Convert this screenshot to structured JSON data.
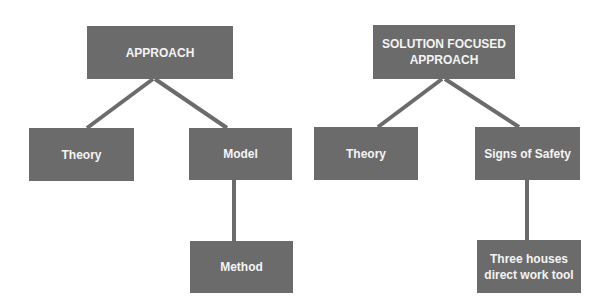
{
  "colors": {
    "node_fill": "#6b6b6b",
    "node_text": "#f4f4f4",
    "connector": "#6b6b6b",
    "background": "#ffffff"
  },
  "diagrams": [
    {
      "root": {
        "label": "APPROACH",
        "box": {
          "x": 87,
          "y": 26,
          "w": 146,
          "h": 53
        }
      },
      "children": [
        {
          "label": "Theory",
          "box": {
            "x": 29,
            "y": 128,
            "w": 105,
            "h": 53
          }
        },
        {
          "label": "Model",
          "box": {
            "x": 189,
            "y": 128,
            "w": 103,
            "h": 52
          },
          "children": [
            {
              "label": "Method",
              "box": {
                "x": 190,
                "y": 241,
                "w": 103,
                "h": 52
              }
            }
          ]
        }
      ]
    },
    {
      "root": {
        "label_line1": "SOLUTION FOCUSED",
        "label_line2": "APPROACH",
        "box": {
          "x": 373,
          "y": 25,
          "w": 142,
          "h": 54
        }
      },
      "children": [
        {
          "label": "Theory",
          "box": {
            "x": 314,
            "y": 127,
            "w": 104,
            "h": 53
          }
        },
        {
          "label": "Signs of Safety",
          "box": {
            "x": 475,
            "y": 127,
            "w": 105,
            "h": 53
          },
          "children": [
            {
              "label_line1": "Three houses",
              "label_line2": "direct work tool",
              "box": {
                "x": 477,
                "y": 240,
                "w": 104,
                "h": 53
              }
            }
          ]
        }
      ]
    }
  ]
}
